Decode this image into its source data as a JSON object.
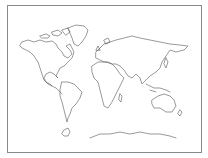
{
  "map": {
    "type": "world-outline",
    "style": "blank continent outline",
    "colors": {
      "background": "#ffffff",
      "outline": "#555555",
      "frame": "#8a8a8a"
    },
    "regions": [
      "north-america",
      "greenland",
      "south-america",
      "europe",
      "africa",
      "asia",
      "australia",
      "new-zealand",
      "antarctica"
    ]
  }
}
